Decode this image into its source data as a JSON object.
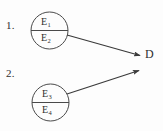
{
  "diagram": {
    "type": "node-arrow-diagram",
    "background_color": "#fdfdfd",
    "stroke_color": "#3a3a3a",
    "text_color": "#2f2f2f",
    "items": [
      {
        "index_label": "1.",
        "circle": {
          "cx": 49.5,
          "cy": 30.5,
          "r": 18.5
        },
        "divider": true,
        "top_label": {
          "base": "E",
          "subscript": "1"
        },
        "bottom_label": {
          "base": "E",
          "subscript": "2"
        },
        "arrow": {
          "x1": 67,
          "y1": 35,
          "x2": 142,
          "y2": 56,
          "direction": "down-right"
        }
      },
      {
        "index_label": "2.",
        "circle": {
          "cx": 50.5,
          "cy": 102.5,
          "r": 18.5
        },
        "divider": true,
        "top_label": {
          "base": "E",
          "subscript": "3"
        },
        "bottom_label": {
          "base": "E",
          "subscript": "4"
        },
        "arrow": {
          "x1": 67,
          "y1": 94,
          "x2": 141,
          "y2": 70,
          "direction": "up-right"
        }
      }
    ],
    "target": {
      "label": "D"
    }
  }
}
